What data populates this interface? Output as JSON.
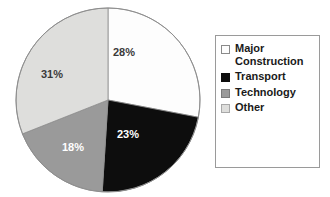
{
  "chart_data": {
    "type": "pie",
    "title": "",
    "subtitle": "",
    "xlabel": "",
    "ylabel": "",
    "legend_position": "right",
    "grid": false,
    "categories": [
      "Major Construction",
      "Transport",
      "Technology",
      "Other"
    ],
    "values": [
      28,
      23,
      18,
      31
    ],
    "value_labels": [
      "28%",
      "23%",
      "18%",
      "31%"
    ],
    "value_unit": "%",
    "colors": [
      "#fdfdfd",
      "#0d0d0d",
      "#9a9a9a",
      "#dededc"
    ],
    "start_angle_deg": 0,
    "direction": "clockwise",
    "slices": [
      {
        "name": "Major Construction",
        "value": 28,
        "label": "28%",
        "color": "#fdfdfd",
        "label_color": "#3a3a3a",
        "start_deg": 0,
        "end_deg": 100.8,
        "label_x": 113,
        "label_y": 46
      },
      {
        "name": "Transport",
        "value": 23,
        "label": "23%",
        "color": "#0d0d0d",
        "label_color": "#ffffff",
        "start_deg": 100.8,
        "end_deg": 183.6,
        "label_x": 117,
        "label_y": 128
      },
      {
        "name": "Technology",
        "value": 18,
        "label": "18%",
        "color": "#9a9a9a",
        "label_color": "#ffffff",
        "start_deg": 183.6,
        "end_deg": 248.4,
        "label_x": 62,
        "label_y": 141
      },
      {
        "name": "Other",
        "value": 31,
        "label": "31%",
        "color": "#dededc",
        "label_color": "#3a3a3a",
        "start_deg": 248.4,
        "end_deg": 360,
        "label_x": 41,
        "label_y": 68
      }
    ]
  },
  "legend": {
    "border_color": "#9a9a9a",
    "background": "#ffffff",
    "items": [
      {
        "label": "Major Construction",
        "swatch_color": "#fdfdfd",
        "swatch_border": "#8a8a8a"
      },
      {
        "label": "Transport",
        "swatch_color": "#0d0d0d",
        "swatch_border": "#0d0d0d"
      },
      {
        "label": "Technology",
        "swatch_color": "#9a9a9a",
        "swatch_border": "#7a7a7a"
      },
      {
        "label": "Other",
        "swatch_color": "#dededc",
        "swatch_border": "#a8a8a8"
      }
    ]
  }
}
